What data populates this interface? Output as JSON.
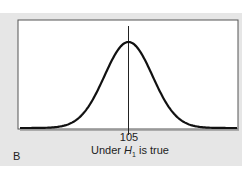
{
  "chart_data": {
    "type": "line",
    "title": "",
    "panel_label": "B",
    "xlabel": "Under H1 is true",
    "xlabel_parts": {
      "prefix": "Under ",
      "var": "H",
      "sub": "1",
      "suffix": " is true"
    },
    "ylabel": "",
    "x_ticks": [
      "105"
    ],
    "mean": 105,
    "distribution": "normal",
    "grid": false,
    "legend": null,
    "series": [
      {
        "name": "sampling distribution under H1",
        "x": [
          -3,
          -2.5,
          -2,
          -1.5,
          -1,
          -0.5,
          0,
          0.5,
          1,
          1.5,
          2,
          2.5,
          3
        ],
        "values": [
          0.004,
          0.018,
          0.054,
          0.13,
          0.242,
          0.352,
          0.399,
          0.352,
          0.242,
          0.13,
          0.054,
          0.018,
          0.004
        ]
      }
    ],
    "reference_line": {
      "x": 105,
      "orientation": "vertical"
    },
    "colors": {
      "curve": "#111111",
      "background": "#e6e6e6",
      "plot_bg": "#ffffff"
    }
  }
}
